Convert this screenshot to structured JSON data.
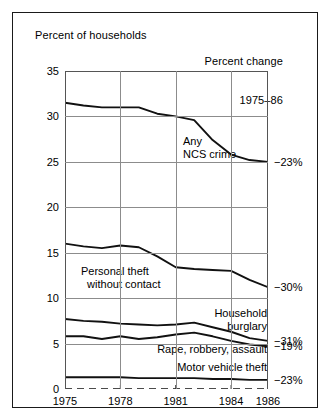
{
  "header": {
    "left_title": "Percent of households",
    "right_title_line1": "Percent change",
    "right_title_line2": "1975–86"
  },
  "chart_data": {
    "type": "line",
    "title": "Percent of households",
    "xlabel": "",
    "ylabel": "Percent of households",
    "xlim": [
      1975,
      1986
    ],
    "ylim": [
      0,
      35
    ],
    "yticks": [
      0,
      5,
      10,
      15,
      20,
      25,
      30,
      35
    ],
    "ytick_labels": [
      "0",
      "5",
      "10",
      "15",
      "20",
      "25",
      "30",
      "35"
    ],
    "xticks": [
      1975,
      1978,
      1981,
      1984,
      1986
    ],
    "xtick_labels": [
      "1975",
      "1978",
      "1981",
      "1984",
      "1986"
    ],
    "grid": true,
    "legend": "inline-annotations",
    "x": [
      1975,
      1976,
      1977,
      1978,
      1979,
      1980,
      1981,
      1982,
      1983,
      1984,
      1985,
      1986
    ],
    "series": [
      {
        "name": "Any NCS crime",
        "label": "Any\nNCS crime",
        "percent_change": "−23%",
        "values": [
          31.5,
          31.2,
          31.0,
          31.0,
          31.0,
          30.3,
          30.0,
          29.6,
          27.4,
          25.8,
          25.2,
          25.0
        ]
      },
      {
        "name": "Personal theft without contact",
        "label": "Personal theft\n  without contact",
        "percent_change": "−30%",
        "values": [
          16.0,
          15.7,
          15.5,
          15.8,
          15.6,
          14.6,
          13.4,
          13.2,
          13.1,
          13.0,
          12.0,
          11.2
        ]
      },
      {
        "name": "Household burglary",
        "label": "Household\nburglary",
        "percent_change": "−31%",
        "values": [
          7.7,
          7.5,
          7.4,
          7.2,
          7.1,
          7.0,
          7.1,
          7.3,
          6.8,
          6.3,
          5.6,
          5.3
        ]
      },
      {
        "name": "Rape, robbery, assault",
        "label": "Rape, robbery, assault",
        "percent_change": "−19%",
        "values": [
          5.8,
          5.8,
          5.5,
          5.8,
          5.5,
          5.7,
          6.0,
          6.2,
          5.8,
          5.3,
          4.9,
          4.7
        ]
      },
      {
        "name": "Motor vehicle theft",
        "label": "Motor vehicle theft",
        "percent_change": "−23%",
        "values": [
          1.3,
          1.3,
          1.3,
          1.3,
          1.2,
          1.2,
          1.2,
          1.2,
          1.1,
          1.1,
          1.0,
          1.0
        ]
      }
    ]
  }
}
